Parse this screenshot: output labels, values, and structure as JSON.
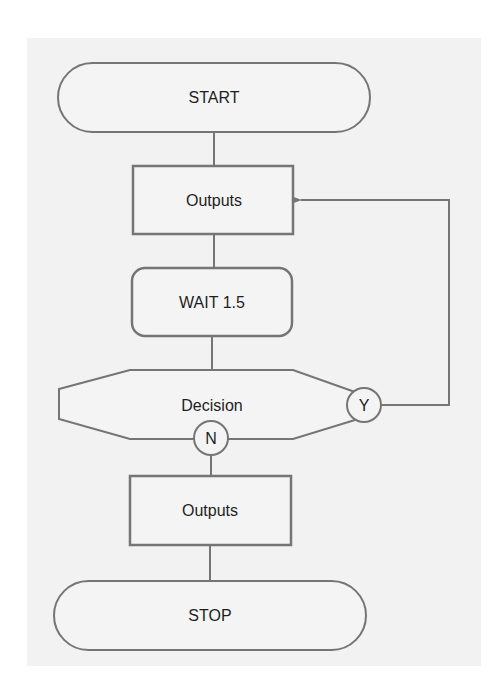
{
  "diagram": {
    "type": "flowchart",
    "colors": {
      "page_background": "#ffffff",
      "panel_background": "#f2f2f2",
      "shape_fill": "#f4f4f4",
      "stroke": "#757575",
      "text": "#1e1e1e"
    },
    "nodes": [
      {
        "id": "start",
        "shape": "terminator",
        "label": "START"
      },
      {
        "id": "outputs1",
        "shape": "process",
        "label": "Outputs"
      },
      {
        "id": "wait",
        "shape": "rounded-process",
        "label": "WAIT 1.5"
      },
      {
        "id": "decision",
        "shape": "decision-hexagon",
        "label": "Decision"
      },
      {
        "id": "outputs2",
        "shape": "process",
        "label": "Outputs"
      },
      {
        "id": "stop",
        "shape": "terminator",
        "label": "STOP"
      }
    ],
    "branches": {
      "yes": "Y",
      "no": "N"
    },
    "edges": [
      {
        "from": "start",
        "to": "outputs1"
      },
      {
        "from": "outputs1",
        "to": "wait"
      },
      {
        "from": "wait",
        "to": "decision"
      },
      {
        "from": "decision",
        "to": "outputs1",
        "branch": "Y",
        "arrow": true
      },
      {
        "from": "decision",
        "to": "outputs2",
        "branch": "N"
      },
      {
        "from": "outputs2",
        "to": "stop"
      }
    ]
  }
}
